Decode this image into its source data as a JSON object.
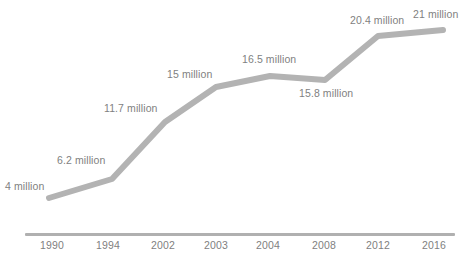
{
  "chart_data": {
    "type": "line",
    "title": "",
    "subtitle": "",
    "xlabel": "",
    "ylabel": "",
    "grid": false,
    "legend": false,
    "legend_position": "none",
    "line_color": "#b3b3b3",
    "label_color": "#7f7f7f",
    "axis_color": "#b0b0b0",
    "categories": [
      "1990",
      "1994",
      "2002",
      "2003",
      "2004",
      "2008",
      "2012",
      "2016"
    ],
    "values": [
      4,
      6.2,
      11.7,
      15,
      16.5,
      15.8,
      20.4,
      21
    ],
    "value_labels": [
      "4 million",
      "6.2 million",
      "11.7 million",
      "15 million",
      "16.5 million",
      "15.8 million",
      "20.4 million",
      "21 million"
    ],
    "unit": "million",
    "ylim": [
      0,
      22
    ],
    "xlim": [
      "1990",
      "2016"
    ],
    "points": [
      {
        "category": "1990",
        "value": 4,
        "label": "4 million",
        "px": 49,
        "py": 198,
        "lx": 5,
        "ly": 180,
        "tx": 52
      },
      {
        "category": "1994",
        "value": 6.2,
        "label": "6.2 million",
        "px": 112,
        "py": 179,
        "lx": 57,
        "ly": 154,
        "tx": 108
      },
      {
        "category": "2002",
        "value": 11.7,
        "label": "11.7 million",
        "px": 165,
        "py": 122,
        "lx": 104,
        "ly": 102,
        "tx": 163
      },
      {
        "category": "2003",
        "value": 15,
        "label": "15 million",
        "px": 216,
        "py": 87,
        "lx": 167,
        "ly": 68,
        "tx": 216
      },
      {
        "category": "2004",
        "value": 16.5,
        "label": "16.5 million",
        "px": 270,
        "py": 76,
        "lx": 242,
        "ly": 53,
        "tx": 268
      },
      {
        "category": "2008",
        "value": 15.8,
        "label": "15.8 million",
        "px": 325,
        "py": 80,
        "lx": 299,
        "ly": 87,
        "tx": 324
      },
      {
        "category": "2012",
        "value": 20.4,
        "label": "20.4 million",
        "px": 378,
        "py": 36,
        "lx": 350,
        "ly": 14,
        "tx": 378
      },
      {
        "category": "2016",
        "value": 21,
        "label": "21 million",
        "px": 443,
        "py": 30,
        "lx": 413,
        "ly": 8,
        "tx": 434
      }
    ]
  }
}
